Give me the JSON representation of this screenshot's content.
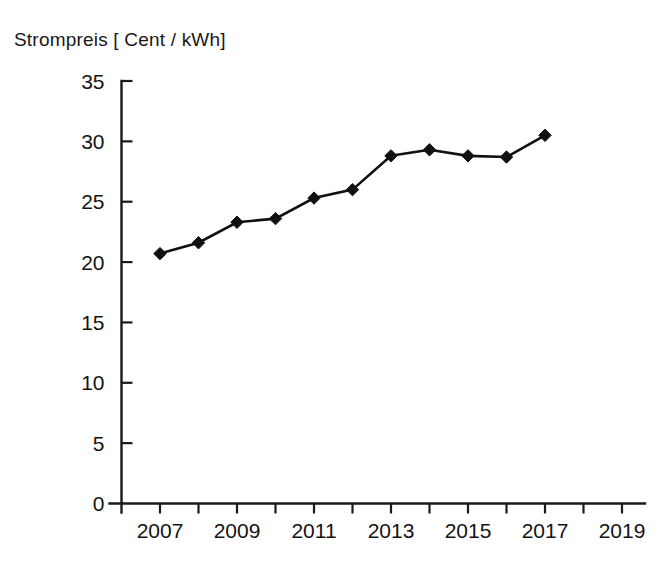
{
  "chart_data": {
    "type": "line",
    "title": "Strompreis [ Cent / kWh]",
    "xlabel": "",
    "ylabel": "",
    "x": [
      2007,
      2008,
      2009,
      2010,
      2011,
      2012,
      2013,
      2014,
      2015,
      2016,
      2017
    ],
    "values": [
      20.7,
      21.6,
      23.3,
      23.6,
      25.3,
      26.0,
      28.8,
      29.3,
      28.8,
      28.7,
      30.5
    ],
    "series": [
      {
        "name": "Strompreis",
        "values": [
          20.7,
          21.6,
          23.3,
          23.6,
          25.3,
          26.0,
          28.8,
          29.3,
          28.8,
          28.7,
          30.5
        ]
      }
    ],
    "xlim": [
      2006,
      2020
    ],
    "ylim": [
      0,
      35
    ],
    "y_ticks": [
      0,
      5,
      10,
      15,
      20,
      25,
      30,
      35
    ],
    "y_tick_labels": [
      "0",
      "5",
      "10",
      "15",
      "20",
      "25",
      "30",
      "35"
    ],
    "x_ticks": [
      2007,
      2008,
      2009,
      2010,
      2011,
      2012,
      2013,
      2014,
      2015,
      2016,
      2017,
      2018,
      2019
    ],
    "x_tick_labels_shown": [
      "2007",
      "2009",
      "2011",
      "2013",
      "2015",
      "2017",
      "2019"
    ],
    "x_labeled_ticks": [
      2007,
      2009,
      2011,
      2013,
      2015,
      2017,
      2019
    ],
    "grid": false,
    "legend": false,
    "marker": "diamond",
    "line_color": "#111111",
    "marker_color": "#111111",
    "background_color": "#ffffff"
  }
}
